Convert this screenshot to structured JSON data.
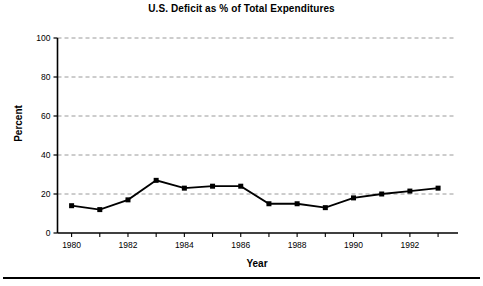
{
  "chart_data": {
    "type": "line",
    "title": "U.S. Deficit as % of Total Expenditures",
    "xlabel": "Year",
    "ylabel": "Percent",
    "x": [
      1980,
      1981,
      1982,
      1983,
      1984,
      1985,
      1986,
      1987,
      1988,
      1989,
      1990,
      1991,
      1992,
      1993
    ],
    "values": [
      14,
      12,
      17,
      27,
      23,
      24,
      24,
      15,
      15,
      13,
      18,
      20,
      21.5,
      23
    ],
    "xlim": [
      1979.5,
      1993.6
    ],
    "ylim": [
      0,
      100
    ],
    "ytick_labels": [
      "0",
      "20",
      "40",
      "60",
      "80",
      "100"
    ],
    "ytick_values": [
      0,
      20,
      40,
      60,
      80,
      100
    ],
    "xtick_values": [
      1980,
      1981,
      1982,
      1983,
      1984,
      1985,
      1986,
      1987,
      1988,
      1989,
      1990,
      1991,
      1992,
      1993
    ],
    "xtick_labels": [
      "1980",
      "",
      "1982",
      "",
      "1984",
      "",
      "1986",
      "",
      "1988",
      "",
      "1990",
      "",
      "1992",
      ""
    ],
    "grid": "horizontal-dashed",
    "legend": "none",
    "marker": "square",
    "line_color": "#000000",
    "marker_color": "#000000",
    "grid_color": "#9a9a9a",
    "background_color": "#ffffff"
  }
}
